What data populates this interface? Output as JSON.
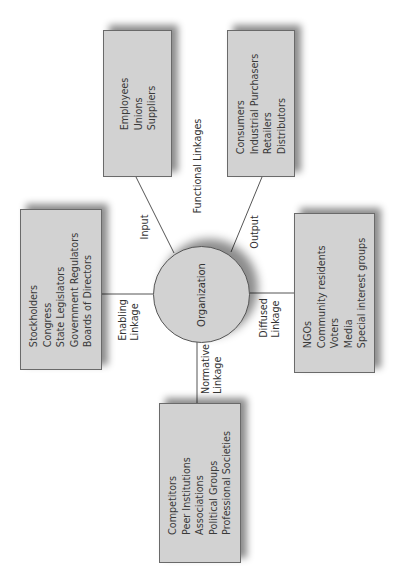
{
  "diagram": {
    "center": {
      "label": "Organization"
    },
    "linkages": {
      "functional": {
        "label": "Functional Linkages"
      },
      "input": {
        "label": "Input"
      },
      "output": {
        "label": "Output"
      },
      "enabling": {
        "line1": "Enabling",
        "line2": "Linkage"
      },
      "diffused": {
        "line1": "Diffused",
        "line2": "Linkage"
      },
      "normative": {
        "line1": "Normative",
        "line2": "Linkage"
      }
    },
    "boxes": {
      "input": {
        "items": [
          "Employees",
          "Unions",
          "Suppliers"
        ]
      },
      "output": {
        "items": [
          "Consumers",
          "Industrial Purchasers",
          "Retailers",
          "Distributors"
        ]
      },
      "enabling": {
        "items": [
          "Stockholders",
          "Congress",
          "State Legislators",
          "Government Regulators",
          "Boards of Directors"
        ]
      },
      "diffused": {
        "items": [
          "NGOs",
          "Community residents",
          "Voters",
          "Media",
          "Special interest groups"
        ]
      },
      "normative": {
        "items": [
          "Competitors",
          "Peer Institutions",
          "Associations",
          "Political Groups",
          "Professional Societies"
        ]
      }
    },
    "colors": {
      "box_fill": "#d2d2d2",
      "border": "#6a6a6a",
      "text": "#333333"
    }
  }
}
